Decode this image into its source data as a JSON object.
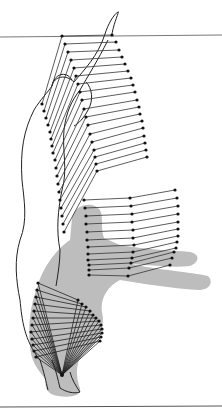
{
  "figure": {
    "type": "stick-figure motion sequence",
    "colors": {
      "stroke": "#222222",
      "marker": "#111111",
      "silhouette_fill": "#bdbdbd",
      "rule": "#555555"
    },
    "rules": {
      "top_y": 37,
      "bottom_y": 406
    },
    "arm_sequence": {
      "shoulder_points": [
        [
          112,
          35
        ],
        [
          116,
          42
        ],
        [
          119,
          50
        ],
        [
          122,
          57
        ],
        [
          125,
          64
        ],
        [
          128,
          71
        ],
        [
          131,
          78
        ],
        [
          133,
          85
        ],
        [
          135,
          92
        ],
        [
          137,
          100
        ],
        [
          139,
          107
        ],
        [
          140,
          114
        ],
        [
          142,
          121
        ],
        [
          143,
          128
        ],
        [
          144,
          136
        ],
        [
          145,
          143
        ],
        [
          146,
          150
        ],
        [
          147,
          157
        ]
      ],
      "elbow_points": [
        [
          62,
          36
        ],
        [
          65,
          44
        ],
        [
          68,
          52
        ],
        [
          71,
          60
        ],
        [
          74,
          68
        ],
        [
          76,
          76
        ],
        [
          78,
          84
        ],
        [
          80,
          92
        ],
        [
          82,
          100
        ],
        [
          84,
          109
        ],
        [
          86,
          117
        ],
        [
          88,
          125
        ],
        [
          90,
          134
        ],
        [
          92,
          142
        ],
        [
          94,
          150
        ],
        [
          95,
          157
        ],
        [
          96,
          164
        ],
        [
          97,
          171
        ]
      ],
      "wrist_points": [
        [
          42,
          104
        ],
        [
          44,
          111
        ],
        [
          46,
          118
        ],
        [
          48,
          125
        ],
        [
          50,
          132
        ],
        [
          51,
          139
        ],
        [
          52,
          146
        ],
        [
          53,
          153
        ],
        [
          55,
          160
        ],
        [
          56,
          168
        ],
        [
          57,
          176
        ],
        [
          58,
          184
        ],
        [
          59,
          192
        ],
        [
          60,
          200
        ],
        [
          61,
          208
        ],
        [
          62,
          216
        ],
        [
          63,
          224
        ],
        [
          64,
          232
        ]
      ]
    },
    "forward_arm_sequence": {
      "trunk_points": [
        [
          84,
          200
        ],
        [
          85,
          208
        ],
        [
          86,
          216
        ],
        [
          86,
          224
        ],
        [
          87,
          232
        ],
        [
          87,
          240
        ],
        [
          88,
          247
        ],
        [
          88,
          254
        ],
        [
          88,
          260
        ],
        [
          89,
          265
        ],
        [
          89,
          270
        ],
        [
          89,
          275
        ]
      ],
      "elbow_points": [
        [
          130,
          198
        ],
        [
          131,
          206
        ],
        [
          132,
          214
        ],
        [
          132,
          222
        ],
        [
          133,
          230
        ],
        [
          133,
          238
        ],
        [
          134,
          245
        ],
        [
          133,
          252
        ],
        [
          132,
          258
        ],
        [
          131,
          263
        ],
        [
          129,
          268
        ],
        [
          128,
          276
        ]
      ],
      "hand_points": [
        [
          175,
          190
        ],
        [
          177,
          198
        ],
        [
          178,
          206
        ],
        [
          178,
          214
        ],
        [
          178,
          222
        ],
        [
          178,
          229
        ],
        [
          178,
          236
        ],
        [
          177,
          242
        ],
        [
          176,
          248
        ],
        [
          174,
          252
        ],
        [
          172,
          258
        ],
        [
          170,
          265
        ]
      ]
    },
    "leg_sequence": {
      "hip_points": [
        [
          38,
          283
        ],
        [
          37,
          290
        ],
        [
          36,
          297
        ],
        [
          35,
          304
        ],
        [
          34,
          311
        ],
        [
          33,
          318
        ],
        [
          32,
          325
        ],
        [
          31,
          332
        ],
        [
          32,
          339
        ],
        [
          33,
          345
        ],
        [
          34,
          351
        ],
        [
          36,
          357
        ]
      ],
      "knee_points": [
        [
          78,
          300
        ],
        [
          82,
          304
        ],
        [
          86,
          307
        ],
        [
          90,
          311
        ],
        [
          93,
          315
        ],
        [
          96,
          318
        ],
        [
          99,
          321
        ],
        [
          101,
          325
        ],
        [
          102,
          329
        ],
        [
          102,
          333
        ],
        [
          101,
          337
        ],
        [
          100,
          341
        ]
      ],
      "ankle_point": [
        62,
        375
      ]
    }
  }
}
